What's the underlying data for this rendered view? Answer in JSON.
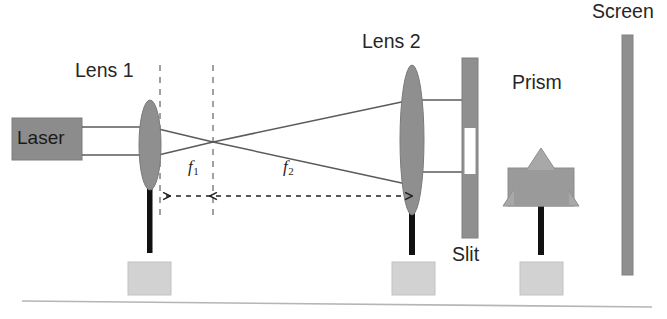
{
  "figure": {
    "type": "optics-setup-diagram",
    "background_color": "#ffffff",
    "labels": {
      "lens1": "Lens 1",
      "lens2": "Lens 2",
      "prism": "Prism",
      "screen": "Screen",
      "slit": "Slit",
      "laser": "Laser",
      "f1": "f",
      "f1_sub": "1",
      "f2": "f",
      "f2_sub": "2"
    },
    "colors": {
      "laser_box": "#8c8c8c",
      "lens_gray": "#8f8f8f",
      "slit_bar": "#8f8f8f",
      "slit_aperture": "#ffffff",
      "prism_triangle": "#a8a8a8",
      "prism_mount": "#9a9a9a",
      "screen_bar": "#8f8f8f",
      "stand_base": "#d2d2d2",
      "post_black": "#111111",
      "ray_line": "#4d4d4d",
      "dashed_guide": "#8a8a8a",
      "table_line": "#b5b5b5",
      "text": "#262626"
    },
    "components": [
      {
        "name": "laser",
        "label": "Laser",
        "x": 12,
        "y": 118,
        "width": 70,
        "height": 42
      },
      {
        "name": "lens1",
        "label": "Lens 1",
        "center_x": 150,
        "center_y": 145,
        "rx": 11,
        "ry": 45
      },
      {
        "name": "focal-point-1",
        "center_x": 213,
        "center_y": 142
      },
      {
        "name": "lens2",
        "label": "Lens 2",
        "center_x": 412,
        "center_y": 140,
        "rx": 12,
        "ry": 75
      },
      {
        "name": "slit",
        "label": "Slit",
        "x": 462,
        "y": 58,
        "width": 16,
        "height": 180,
        "aperture_y": 128,
        "aperture_height": 46
      },
      {
        "name": "prism",
        "label": "Prism",
        "apex_x": 541,
        "apex_y": 148,
        "base_y": 205,
        "half_width": 38
      },
      {
        "name": "screen",
        "label": "Screen",
        "x": 622,
        "y": 35,
        "width": 11,
        "height": 240
      }
    ],
    "measurements": [
      {
        "name": "f1",
        "label": "f1",
        "from_x": 160,
        "to_x": 213,
        "y": 196
      },
      {
        "name": "f2",
        "label": "f2",
        "from_x": 213,
        "to_x": 410,
        "y": 196
      }
    ],
    "guides": {
      "dashed_vertical_x": [
        160,
        213
      ],
      "dashed_vertical_top": 65,
      "dashed_vertical_bottom": 216
    }
  }
}
